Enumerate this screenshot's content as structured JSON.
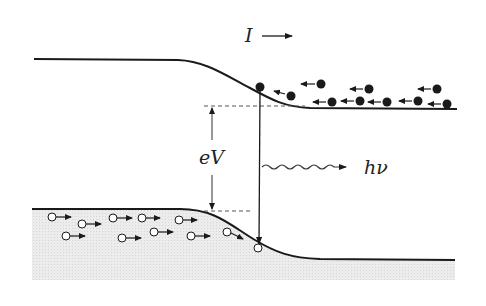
{
  "diagram": {
    "type": "led-band-diagram",
    "labels": {
      "current": "I",
      "voltage": "eV",
      "photon": "hν"
    },
    "colors": {
      "line": "#1a1a1a",
      "dashed": "#555555",
      "shade": "#e6e6e6",
      "electron": "#1a1a1a",
      "hole_fill": "#ffffff"
    },
    "bands": {
      "conduction": {
        "left_y": 59,
        "right_y": 109,
        "x_start": 34,
        "x_end": 457
      },
      "valence": {
        "left_y": 209,
        "right_y": 260,
        "x_start": 32,
        "x_end": 455
      }
    },
    "electrons": [
      {
        "x": 260,
        "y": 87,
        "arrow": false
      },
      {
        "x": 291,
        "y": 95
      },
      {
        "x": 321,
        "y": 84
      },
      {
        "x": 332,
        "y": 102
      },
      {
        "x": 360,
        "y": 101
      },
      {
        "x": 369,
        "y": 89
      },
      {
        "x": 387,
        "y": 102
      },
      {
        "x": 418,
        "y": 101
      },
      {
        "x": 437,
        "y": 89
      },
      {
        "x": 447,
        "y": 104
      }
    ],
    "holes": [
      {
        "x": 52,
        "y": 217
      },
      {
        "x": 82,
        "y": 224
      },
      {
        "x": 66,
        "y": 236
      },
      {
        "x": 113,
        "y": 218
      },
      {
        "x": 142,
        "y": 218
      },
      {
        "x": 122,
        "y": 238
      },
      {
        "x": 154,
        "y": 232
      },
      {
        "x": 179,
        "y": 220
      },
      {
        "x": 191,
        "y": 236
      },
      {
        "x": 227,
        "y": 232
      },
      {
        "x": 258,
        "y": 248,
        "arrow": false
      }
    ]
  }
}
